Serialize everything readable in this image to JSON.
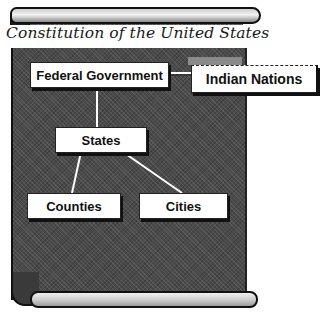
{
  "title": "Constitution of the United States",
  "diagram": {
    "type": "hierarchy",
    "nodes": {
      "federal_government": "Federal Government",
      "indian_nations": "Indian Nations",
      "states": "States",
      "counties": "Counties",
      "cities": "Cities"
    },
    "edges": [
      [
        "Federal Government",
        "Indian Nations"
      ],
      [
        "Federal Government",
        "States"
      ],
      [
        "States",
        "Counties"
      ],
      [
        "States",
        "Cities"
      ]
    ]
  },
  "colors": {
    "scroll": "#4a4a4a",
    "box_fill": "#ffffff",
    "text": "#111111",
    "connector": "#ffffff"
  }
}
